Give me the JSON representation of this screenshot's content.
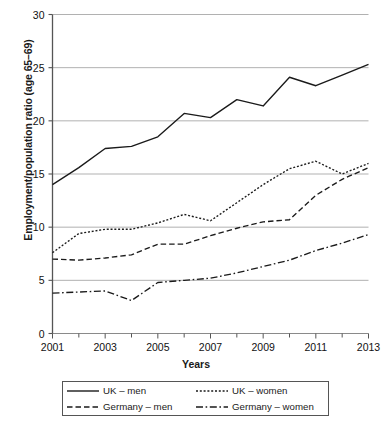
{
  "chart_data": {
    "type": "line",
    "title": "",
    "xlabel": "Years",
    "ylabel": "Employment/population ratio (age 65–69)",
    "x": [
      2001,
      2002,
      2003,
      2004,
      2005,
      2006,
      2007,
      2008,
      2009,
      2010,
      2011,
      2012,
      2013
    ],
    "xtick_labels": [
      "2001",
      "2003",
      "2005",
      "2007",
      "2009",
      "2011",
      "2013"
    ],
    "xtick_values": [
      2001,
      2003,
      2005,
      2007,
      2009,
      2011,
      2013
    ],
    "ytick_labels": [
      "0",
      "5",
      "10",
      "15",
      "20",
      "25",
      "30"
    ],
    "ytick_values": [
      0,
      5,
      10,
      15,
      20,
      25,
      30
    ],
    "xlim": [
      2001,
      2013
    ],
    "ylim": [
      0,
      30
    ],
    "grid": "horizontal",
    "legend_position": "bottom",
    "series": [
      {
        "name": "UK – men",
        "style": "solid",
        "color": "#1a1a1a",
        "values": [
          14.0,
          15.6,
          17.4,
          17.6,
          18.5,
          20.7,
          20.3,
          22.0,
          21.4,
          24.1,
          23.3,
          24.3,
          25.3
        ]
      },
      {
        "name": "UK – women",
        "style": "dotted",
        "color": "#1a1a1a",
        "values": [
          7.6,
          9.4,
          9.8,
          9.8,
          10.4,
          11.2,
          10.6,
          12.3,
          14.0,
          15.5,
          16.2,
          15.0,
          16.0
        ]
      },
      {
        "name": "Germany – men",
        "style": "dashed",
        "color": "#1a1a1a",
        "values": [
          7.0,
          6.9,
          7.1,
          7.4,
          8.4,
          8.4,
          9.2,
          9.9,
          10.5,
          10.7,
          13.0,
          14.5,
          15.6
        ]
      },
      {
        "name": "Germany – women",
        "style": "dashdot",
        "color": "#1a1a1a",
        "values": [
          3.8,
          3.9,
          4.0,
          3.1,
          4.8,
          5.0,
          5.2,
          5.7,
          6.3,
          6.9,
          7.8,
          8.5,
          9.3
        ]
      }
    ]
  },
  "legend": {
    "items": [
      {
        "label": "UK – men",
        "style": "solid"
      },
      {
        "label": "UK – women",
        "style": "dotted"
      },
      {
        "label": "Germany – men",
        "style": "dashed"
      },
      {
        "label": "Germany – women",
        "style": "dashdot"
      }
    ]
  }
}
